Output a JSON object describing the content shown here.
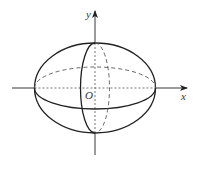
{
  "diagram": {
    "type": "ellipsoid-with-axes",
    "labels": {
      "x_axis": "x",
      "y_axis": "y",
      "origin": "O"
    },
    "colors": {
      "stroke": "#222222",
      "dashed": "#555555",
      "background": "#ffffff"
    },
    "shapes": {
      "outer_ellipse": {
        "cx": 95,
        "cy": 88,
        "rx": 60.5,
        "ry": 45
      },
      "equator_ellipse": {
        "cx": 95,
        "cy": 88,
        "rx": 60.5,
        "ry": 21,
        "front": "solid",
        "back": "dashed"
      },
      "meridian_ellipse": {
        "cx": 95,
        "cy": 88,
        "rx": 14.5,
        "ry": 45,
        "left": "solid",
        "right": "dashed"
      }
    }
  }
}
